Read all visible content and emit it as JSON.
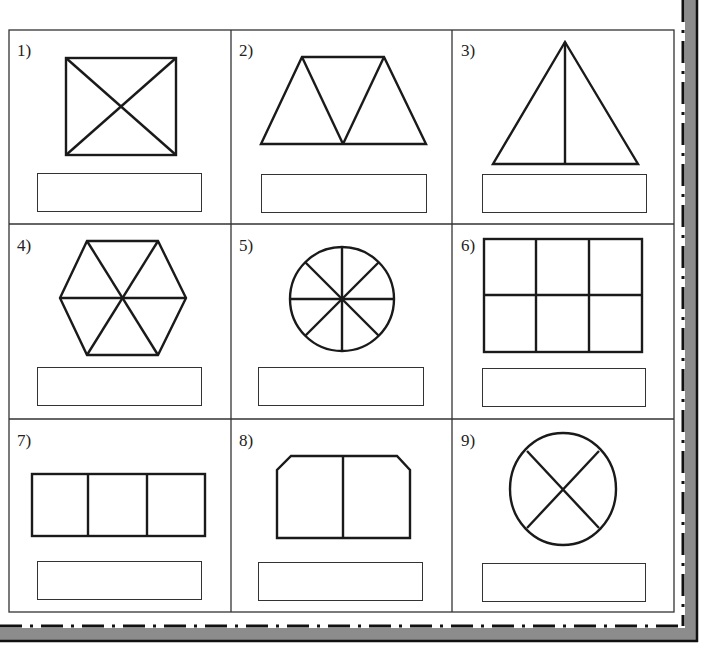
{
  "worksheet": {
    "colors": {
      "ink": "#222222",
      "frame_gray": "#8c8c8c",
      "background": "#ffffff"
    },
    "problems": [
      {
        "number": "1)",
        "shape": "rectangle-with-diagonals",
        "answer": ""
      },
      {
        "number": "2)",
        "shape": "trapezoid-three-triangles",
        "answer": ""
      },
      {
        "number": "3)",
        "shape": "triangle-split-in-half",
        "answer": ""
      },
      {
        "number": "4)",
        "shape": "hexagon-six-triangles",
        "answer": ""
      },
      {
        "number": "5)",
        "shape": "circle-eight-sectors",
        "answer": ""
      },
      {
        "number": "6)",
        "shape": "rectangle-six-cells",
        "answer": ""
      },
      {
        "number": "7)",
        "shape": "rectangle-three-cells",
        "answer": ""
      },
      {
        "number": "8)",
        "shape": "cut-corner-rectangle-halves",
        "answer": ""
      },
      {
        "number": "9)",
        "shape": "circle-four-sectors",
        "answer": ""
      }
    ]
  }
}
